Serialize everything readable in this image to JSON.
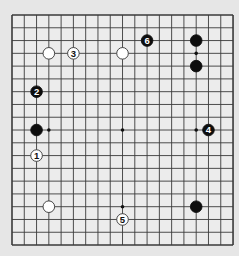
{
  "board": {
    "size": 19,
    "origin_x": 12,
    "origin_y": 15,
    "spacing_x": 12.28,
    "spacing_y": 12.78,
    "background": "#e6e6e6",
    "board_fill": "#ececec",
    "line_color": "#3a3a3a",
    "star_points": [
      [
        15,
        3
      ],
      [
        3,
        9
      ],
      [
        9,
        9
      ],
      [
        15,
        9
      ],
      [
        9,
        15
      ],
      [
        3,
        3
      ],
      [
        9,
        3
      ],
      [
        3,
        15
      ],
      [
        15,
        15
      ]
    ]
  },
  "stones": [
    {
      "color": "white",
      "col": 3,
      "row": 3,
      "label": ""
    },
    {
      "color": "white",
      "col": 9,
      "row": 3,
      "label": ""
    },
    {
      "color": "white",
      "col": 3,
      "row": 15,
      "label": ""
    },
    {
      "color": "white",
      "col": 2,
      "row": 11,
      "label": "1"
    },
    {
      "color": "white",
      "col": 5,
      "row": 3,
      "label": "3"
    },
    {
      "color": "white",
      "col": 9,
      "row": 16,
      "label": "5"
    },
    {
      "color": "black",
      "col": 15,
      "row": 2,
      "label": ""
    },
    {
      "color": "black",
      "col": 15,
      "row": 4,
      "label": ""
    },
    {
      "color": "black",
      "col": 2,
      "row": 9,
      "label": ""
    },
    {
      "color": "black",
      "col": 15,
      "row": 15,
      "label": ""
    },
    {
      "color": "black",
      "col": 2,
      "row": 6,
      "label": "2"
    },
    {
      "color": "black",
      "col": 16,
      "row": 9,
      "label": "4"
    },
    {
      "color": "black",
      "col": 11,
      "row": 2,
      "label": "6"
    }
  ]
}
